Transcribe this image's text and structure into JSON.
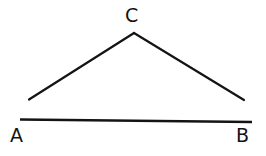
{
  "figure": {
    "kind": "geometry-line-drawing",
    "width": 266,
    "height": 156,
    "background_color": "#ffffff",
    "stroke_color": "#141414",
    "text_color": "#141414",
    "labels": {
      "apex": "C",
      "left_base": "A",
      "right_base": "B"
    },
    "strokes": [
      {
        "name": "base-segment-ab",
        "description": "horizontal base line from A side to B side",
        "x1": 20,
        "y1": 119.5,
        "x2": 252,
        "y2": 122,
        "width": 2.6
      },
      {
        "name": "left-side-segment-ac",
        "description": "slanted line rising from lower left to apex C",
        "x1": 29,
        "y1": 99.5,
        "x2": 134,
        "y2": 33,
        "width": 2.2
      },
      {
        "name": "right-side-segment-cb",
        "description": "slanted line falling from apex C to lower right",
        "x1": 134,
        "y1": 33,
        "x2": 244,
        "y2": 100,
        "width": 2.2
      }
    ]
  }
}
